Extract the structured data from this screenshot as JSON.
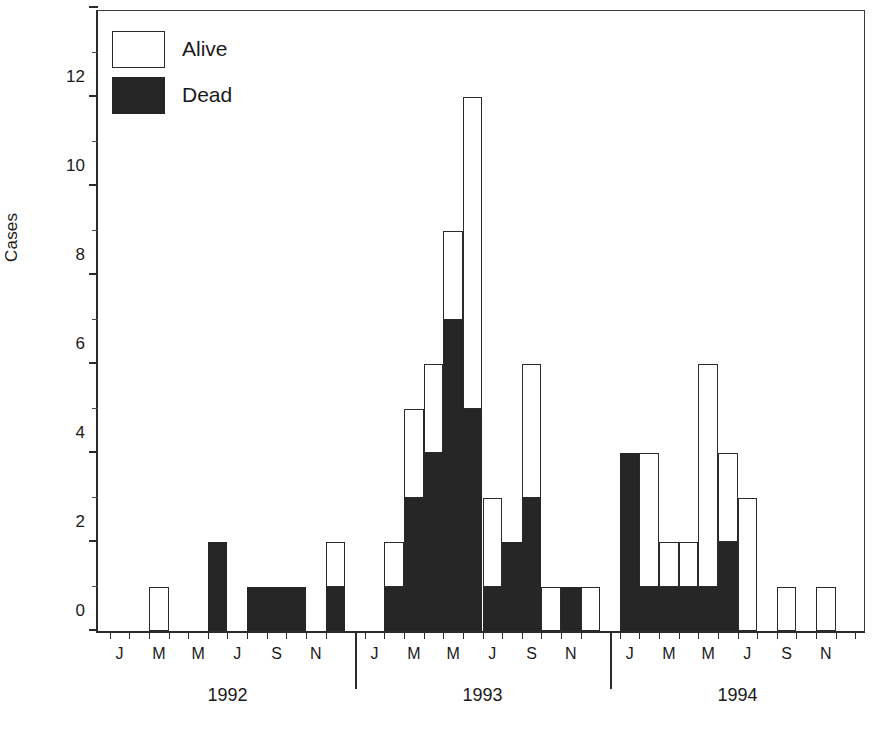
{
  "chart_data": {
    "type": "bar",
    "title": "",
    "subtitle": "",
    "xlabel": "",
    "ylabel": "Cases",
    "ylim": [
      0,
      14
    ],
    "ytick_values": [
      0,
      2,
      4,
      6,
      8,
      10,
      12,
      14
    ],
    "ytick_labels": [
      "0",
      "2",
      "4",
      "6",
      "8",
      "10",
      "12",
      "14"
    ],
    "yminor_step": 1,
    "grid": false,
    "stacked": true,
    "legend_position": "top-left",
    "legend": [
      "Alive",
      "Dead"
    ],
    "series": [
      {
        "name": "Dead",
        "color": "#262626",
        "values": [
          0,
          0,
          0,
          0,
          0,
          2,
          0,
          1,
          1,
          1,
          0,
          1,
          0,
          1,
          3,
          4,
          7,
          5,
          1,
          2,
          3,
          0,
          1,
          0,
          4,
          1,
          1,
          1,
          1,
          2,
          0
        ]
      },
      {
        "name": "Alive",
        "color": "#ffffff",
        "values": [
          0,
          0,
          1,
          0,
          0,
          0,
          0,
          0,
          0,
          0,
          0,
          1,
          0,
          1,
          2,
          2,
          2,
          7,
          2,
          0,
          3,
          1,
          0,
          1,
          0,
          3,
          1,
          1,
          5,
          2,
          3
        ]
      }
    ],
    "totals": [
      0,
      0,
      1,
      0,
      0,
      2,
      0,
      1,
      1,
      1,
      0,
      2,
      0,
      2,
      5,
      6,
      9,
      12,
      3,
      2,
      6,
      1,
      1,
      1,
      4,
      4,
      2,
      2,
      6,
      4,
      3
    ],
    "x_groups": [
      {
        "year": "1992",
        "months": [
          "J",
          "F",
          "M",
          "A",
          "M",
          "J",
          "J",
          "A",
          "S",
          "O",
          "N",
          "D"
        ],
        "labeled_months": [
          "J",
          "M",
          "M",
          "J",
          "S",
          "N"
        ]
      },
      {
        "year": "1993",
        "months": [
          "J",
          "F",
          "M",
          "A",
          "M",
          "J",
          "J",
          "A",
          "S",
          "O",
          "N",
          "D"
        ],
        "labeled_months": [
          "J",
          "M",
          "M",
          "J",
          "S",
          "N"
        ]
      },
      {
        "year": "1994",
        "months": [
          "J",
          "F",
          "M",
          "A",
          "M",
          "J",
          "J",
          "A",
          "S",
          "O",
          "N",
          "D"
        ],
        "labeled_months": [
          "J",
          "M",
          "M",
          "J",
          "S",
          "N"
        ]
      }
    ],
    "bars": [
      {
        "year": "1992",
        "month": "J",
        "dead": 0,
        "alive": 0,
        "total": 0
      },
      {
        "year": "1992",
        "month": "F",
        "dead": 0,
        "alive": 0,
        "total": 0
      },
      {
        "year": "1992",
        "month": "M",
        "dead": 0,
        "alive": 1,
        "total": 1
      },
      {
        "year": "1992",
        "month": "A",
        "dead": 0,
        "alive": 0,
        "total": 0
      },
      {
        "year": "1992",
        "month": "M",
        "dead": 0,
        "alive": 0,
        "total": 0
      },
      {
        "year": "1992",
        "month": "J",
        "dead": 2,
        "alive": 0,
        "total": 2
      },
      {
        "year": "1992",
        "month": "J",
        "dead": 0,
        "alive": 0,
        "total": 0
      },
      {
        "year": "1992",
        "month": "A",
        "dead": 1,
        "alive": 0,
        "total": 1
      },
      {
        "year": "1992",
        "month": "S",
        "dead": 1,
        "alive": 0,
        "total": 1
      },
      {
        "year": "1992",
        "month": "O",
        "dead": 1,
        "alive": 0,
        "total": 1
      },
      {
        "year": "1992",
        "month": "N",
        "dead": 0,
        "alive": 0,
        "total": 0
      },
      {
        "year": "1992",
        "month": "D",
        "dead": 1,
        "alive": 1,
        "total": 2
      },
      {
        "year": "1993",
        "month": "J",
        "dead": 0,
        "alive": 0,
        "total": 0
      },
      {
        "year": "1993",
        "month": "F",
        "dead": 1,
        "alive": 1,
        "total": 2
      },
      {
        "year": "1993",
        "month": "M",
        "dead": 3,
        "alive": 2,
        "total": 5
      },
      {
        "year": "1993",
        "month": "A",
        "dead": 4,
        "alive": 2,
        "total": 6
      },
      {
        "year": "1993",
        "month": "M",
        "dead": 7,
        "alive": 2,
        "total": 9
      },
      {
        "year": "1993",
        "month": "J",
        "dead": 5,
        "alive": 7,
        "total": 12
      },
      {
        "year": "1993",
        "month": "J",
        "dead": 1,
        "alive": 2,
        "total": 3
      },
      {
        "year": "1993",
        "month": "A",
        "dead": 2,
        "alive": 0,
        "total": 2
      },
      {
        "year": "1993",
        "month": "S",
        "dead": 3,
        "alive": 3,
        "total": 6
      },
      {
        "year": "1993",
        "month": "O",
        "dead": 0,
        "alive": 1,
        "total": 1
      },
      {
        "year": "1993",
        "month": "N",
        "dead": 1,
        "alive": 0,
        "total": 1
      },
      {
        "year": "1993",
        "month": "D",
        "dead": 0,
        "alive": 1,
        "total": 1
      },
      {
        "year": "1994",
        "month": "J",
        "dead": 4,
        "alive": 0,
        "total": 4
      },
      {
        "year": "1994",
        "month": "F",
        "dead": 1,
        "alive": 3,
        "total": 4
      },
      {
        "year": "1994",
        "month": "M",
        "dead": 1,
        "alive": 1,
        "total": 2
      },
      {
        "year": "1994",
        "month": "A",
        "dead": 1,
        "alive": 1,
        "total": 2
      },
      {
        "year": "1994",
        "month": "M",
        "dead": 1,
        "alive": 5,
        "total": 6
      },
      {
        "year": "1994",
        "month": "J",
        "dead": 2,
        "alive": 2,
        "total": 4
      },
      {
        "year": "1994",
        "month": "J",
        "dead": 0,
        "alive": 3,
        "total": 3
      },
      {
        "year": "1994",
        "month": "A",
        "dead": 0,
        "alive": 0,
        "total": 0
      },
      {
        "year": "1994",
        "month": "S",
        "dead": 0,
        "alive": 1,
        "total": 1
      },
      {
        "year": "1994",
        "month": "O",
        "dead": 0,
        "alive": 0,
        "total": 0
      },
      {
        "year": "1994",
        "month": "N",
        "dead": 0,
        "alive": 1,
        "total": 1
      },
      {
        "year": "1994",
        "month": "D",
        "dead": 0,
        "alive": 0,
        "total": 0
      }
    ]
  },
  "axis": {
    "y_title": "Cases"
  },
  "legend": {
    "alive_label": "Alive",
    "dead_label": "Dead"
  },
  "years": {
    "y1992": "1992",
    "y1993": "1993",
    "y1994": "1994"
  },
  "caption": {
    "text": ""
  }
}
